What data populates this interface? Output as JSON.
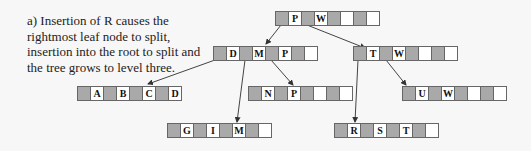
{
  "caption": "a) Insertion of R causes the rightmost leaf node to split, insertion into the root to split and the tree grows to level three.",
  "colors": {
    "pointer_cell": "#a9a9a9",
    "key_cell": "#ffffff",
    "border": "#666666",
    "background": "#f7f7f7"
  },
  "tree": {
    "root": {
      "keys": [
        "P",
        "W",
        "",
        ""
      ]
    },
    "internal": [
      {
        "keys": [
          "D",
          "M",
          "P",
          ""
        ]
      },
      {
        "keys": [
          "T",
          "W",
          "",
          ""
        ]
      }
    ],
    "leaves": [
      {
        "keys": [
          "A",
          "B",
          "C",
          "D"
        ]
      },
      {
        "keys": [
          "G",
          "I",
          "M",
          ""
        ]
      },
      {
        "keys": [
          "N",
          "P",
          "",
          ""
        ]
      },
      {
        "keys": [
          "R",
          "S",
          "T",
          ""
        ]
      },
      {
        "keys": [
          "U",
          "W",
          "",
          ""
        ]
      }
    ]
  }
}
